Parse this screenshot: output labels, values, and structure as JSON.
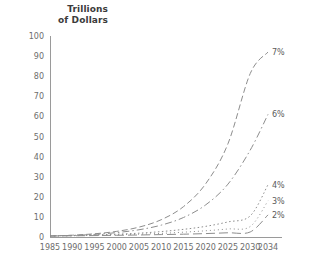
{
  "chart_data": {
    "type": "line",
    "title": "",
    "ylabel_line1": "Trillions",
    "ylabel_line2": "of Dollars",
    "xlabel": "",
    "grid": false,
    "legend_position": "right-inline-end-of-line",
    "xlim": [
      1985,
      2034
    ],
    "ylim": [
      0,
      100
    ],
    "yticks": [
      0,
      10,
      20,
      30,
      40,
      50,
      60,
      70,
      80,
      90,
      100
    ],
    "ytick_labels": [
      "0",
      "10",
      "20",
      "30",
      "40",
      "50",
      "60",
      "70",
      "80",
      "90",
      "100"
    ],
    "xticks": [
      1985,
      1990,
      1995,
      2000,
      2005,
      2010,
      2015,
      2020,
      2025,
      2030,
      2034
    ],
    "xtick_labels": [
      "1985",
      "1990",
      "1995",
      "2000",
      "2005",
      "2010",
      "2015",
      "2020",
      "2025",
      "2030",
      "2034"
    ],
    "x": [
      1985,
      1990,
      1995,
      2000,
      2005,
      2010,
      2015,
      2020,
      2025,
      2030,
      2034
    ],
    "series": [
      {
        "name": "7%",
        "label": "7%",
        "dash": "6,3",
        "color": "#8d8d8d",
        "values": [
          0.5,
          0.9,
          1.6,
          2.8,
          4.9,
          8.6,
          15.1,
          26.5,
          46.4,
          81.3,
          92.0
        ]
      },
      {
        "name": "6%",
        "label": "6%",
        "dash": "7,3,1.5,3",
        "color": "#8d8d8d",
        "values": [
          0.5,
          0.8,
          1.3,
          2.2,
          3.6,
          5.9,
          9.7,
          16.0,
          26.3,
          43.2,
          61.0
        ]
      },
      {
        "name": "4%",
        "label": "4%",
        "dash": "1.5,2.5",
        "color": "#8d8d8d",
        "values": [
          0.5,
          0.7,
          1.0,
          1.4,
          1.9,
          2.7,
          3.8,
          5.3,
          7.5,
          10.5,
          26.0
        ]
      },
      {
        "name": "3%",
        "label": "3%",
        "dash": "1,3",
        "color": "#9c9c9c",
        "values": [
          0.5,
          0.65,
          0.85,
          1.1,
          1.4,
          1.8,
          2.4,
          3.1,
          4.0,
          5.2,
          18.0
        ]
      },
      {
        "name": "2%",
        "label": "2%",
        "dash": "9,4",
        "color": "#9c9c9c",
        "values": [
          0.5,
          0.6,
          0.7,
          0.85,
          1.0,
          1.2,
          1.4,
          1.7,
          2.1,
          2.5,
          11.0
        ]
      }
    ],
    "series_label_positions": [
      {
        "label": "7%",
        "value": 92.0
      },
      {
        "label": "6%",
        "value": 61.0
      },
      {
        "label": "4%",
        "value": 26.0
      },
      {
        "label": "3%",
        "value": 18.0
      },
      {
        "label": "2%",
        "value": 11.0
      }
    ]
  }
}
